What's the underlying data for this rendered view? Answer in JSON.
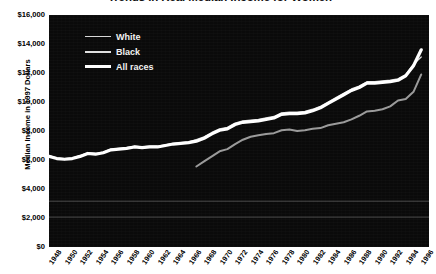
{
  "chart": {
    "title": "Trends in Real Median Income for Women",
    "ylabel": "Median Income in 1997 Dollars",
    "xlabel": ""
  },
  "legend": {
    "position": "top-left",
    "items": [
      {
        "label": "White",
        "width": 1.3,
        "color": "#d8d8d8"
      },
      {
        "label": "Black",
        "width": 2.0,
        "color": "#e0e0e0"
      },
      {
        "label": "All races",
        "width": 3.2,
        "color": "#ffffff"
      }
    ]
  },
  "yticks": [
    "$0",
    "$2,000",
    "$4,000",
    "$6,000",
    "$8,000",
    "$10,000",
    "$12,000",
    "$14,000",
    "$16,000"
  ],
  "xticks": [
    "1948",
    "1950",
    "1952",
    "1954",
    "1956",
    "1958",
    "1960",
    "1962",
    "1964",
    "1966",
    "1968",
    "1970",
    "1972",
    "1974",
    "1976",
    "1978",
    "1980",
    "1982",
    "1984",
    "1986",
    "1988",
    "1990",
    "1992",
    "1994",
    "1996"
  ],
  "chart_data": {
    "type": "line",
    "title": "Trends in Real Median Income for Women",
    "xlabel": "",
    "ylabel": "Median Income in 1997 Dollars",
    "xlim": [
      1948,
      1997
    ],
    "ylim": [
      0,
      16000
    ],
    "ytick_step": 2000,
    "grid": false,
    "background": "#0a0a0a",
    "legend_position": "top-left",
    "x": [
      1948,
      1949,
      1950,
      1951,
      1952,
      1953,
      1954,
      1955,
      1956,
      1957,
      1958,
      1959,
      1960,
      1961,
      1962,
      1963,
      1964,
      1965,
      1966,
      1967,
      1968,
      1969,
      1970,
      1971,
      1972,
      1973,
      1974,
      1975,
      1976,
      1977,
      1978,
      1979,
      1980,
      1981,
      1982,
      1983,
      1984,
      1985,
      1986,
      1987,
      1988,
      1989,
      1990,
      1991,
      1992,
      1993,
      1994,
      1995,
      1996
    ],
    "series": [
      {
        "name": "White",
        "color": "#d8d8d8",
        "linewidth": 1.3,
        "values": [
          6300,
          6150,
          6100,
          6150,
          6300,
          6500,
          6450,
          6550,
          6750,
          6800,
          6850,
          6950,
          6900,
          6950,
          6950,
          7050,
          7150,
          7200,
          7250,
          7400,
          7600,
          7900,
          8150,
          8250,
          8550,
          8700,
          8750,
          8800,
          8900,
          9000,
          9250,
          9300,
          9300,
          9350,
          9500,
          9700,
          10000,
          10300,
          10600,
          10900,
          11100,
          11400,
          11400,
          11450,
          11500,
          11600,
          11900,
          12600,
          13100
        ]
      },
      {
        "name": "Black",
        "color": "#9a9a9a",
        "linewidth": 2.0,
        "start_year": 1967,
        "values": [
          null,
          null,
          null,
          null,
          null,
          null,
          null,
          null,
          null,
          null,
          null,
          null,
          null,
          null,
          null,
          null,
          null,
          null,
          null,
          5550,
          5900,
          6250,
          6600,
          6750,
          7100,
          7400,
          7600,
          7700,
          7800,
          7850,
          8050,
          8100,
          8000,
          8050,
          8150,
          8200,
          8400,
          8500,
          8600,
          8800,
          9050,
          9350,
          9400,
          9500,
          9700,
          10100,
          10200,
          10700,
          11900
        ]
      },
      {
        "name": "All races",
        "color": "#ffffff",
        "linewidth": 3.2,
        "values": [
          6250,
          6100,
          6050,
          6100,
          6250,
          6450,
          6400,
          6500,
          6700,
          6750,
          6800,
          6900,
          6850,
          6900,
          6900,
          7000,
          7100,
          7150,
          7200,
          7300,
          7500,
          7800,
          8050,
          8150,
          8450,
          8600,
          8650,
          8700,
          8800,
          8900,
          9150,
          9200,
          9200,
          9250,
          9400,
          9600,
          9900,
          10200,
          10500,
          10800,
          11000,
          11300,
          11300,
          11350,
          11400,
          11500,
          11800,
          12500,
          13600
        ]
      }
    ]
  }
}
